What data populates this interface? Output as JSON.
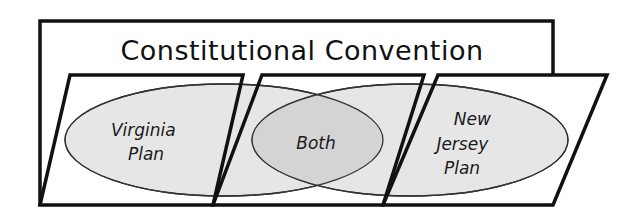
{
  "diagram": {
    "title": "Constitutional Convention",
    "type": "venn-diagram",
    "regions": [
      {
        "id": "left",
        "lines": [
          "Virginia",
          "Plan"
        ]
      },
      {
        "id": "overlap",
        "lines": [
          "Both"
        ]
      },
      {
        "id": "right",
        "lines": [
          "New",
          "Jersey",
          "Plan"
        ]
      }
    ],
    "colors": {
      "stroke": "#111111",
      "ellipse_fill": "#e6e6e6",
      "overlap_fill": "#d4d4d4",
      "background": "#ffffff"
    }
  }
}
